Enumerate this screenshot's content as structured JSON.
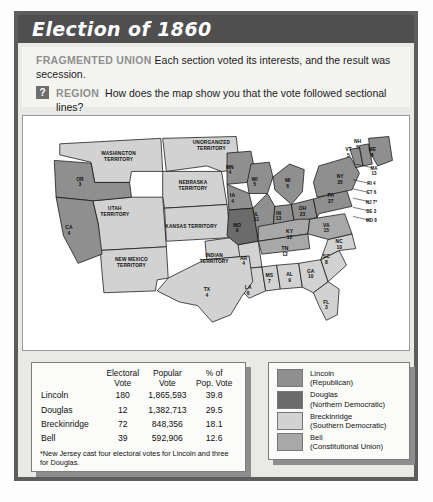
{
  "header": {
    "title": "Election of 1860"
  },
  "caption": {
    "lead": "FRAGMENTED UNION",
    "text": "Each section voted its interests, and the result was secession.",
    "question_icon": "?",
    "region_lead": "REGION",
    "question": "How does the map show you that the vote followed sectional lines?"
  },
  "colors": {
    "lincoln": "#8f8f8f",
    "douglas": "#6b6b6b",
    "breckinridge": "#d2d2d2",
    "bell": "#a8a8a8",
    "water": "#ffffff",
    "title_bar": "#4f4f4f",
    "frame": "#5d5d5d"
  },
  "table": {
    "columns": [
      "",
      "Electoral Vote",
      "Popular Vote",
      "% of Pop. Vote"
    ],
    "column_lines": [
      [
        "",
        ""
      ],
      [
        "Electoral",
        "Vote"
      ],
      [
        "Popular",
        "Vote"
      ],
      [
        "% of",
        "Pop. Vote"
      ]
    ],
    "rows": [
      {
        "name": "Lincoln",
        "electoral": "180",
        "popular": "1,865,593",
        "percent": "39.8"
      },
      {
        "name": "Douglas",
        "electoral": "12",
        "popular": "1,382,713",
        "percent": "29.5"
      },
      {
        "name": "Breckinridge",
        "electoral": "72",
        "popular": "848,356",
        "percent": "18.1"
      },
      {
        "name": "Bell",
        "electoral": "39",
        "popular": "592,906",
        "percent": "12.6"
      }
    ],
    "footnote": "*New Jersey cast four electoral votes for Lincoln and three for Douglas."
  },
  "legend": {
    "items": [
      {
        "name": "Lincoln",
        "party": "(Republican)",
        "color": "#8f8f8f"
      },
      {
        "name": "Douglas",
        "party": "(Northern Democratic)",
        "color": "#6b6b6b"
      },
      {
        "name": "Breckinridge",
        "party": "(Southern Democratic)",
        "color": "#d2d2d2"
      },
      {
        "name": "Bell",
        "party": "(Constitutional Union)",
        "color": "#a8a8a8"
      }
    ]
  },
  "map": {
    "territories": [
      {
        "id": "washington-territory",
        "lines": [
          "WASHINGTON",
          "TERRITORY"
        ],
        "x": 104,
        "y": 32
      },
      {
        "id": "unorganized-territory",
        "lines": [
          "UNORGANIZED",
          "TERRITORY"
        ],
        "x": 205,
        "y": 20
      },
      {
        "id": "nebraska-territory",
        "lines": [
          "NEBRASKA",
          "TERRITORY"
        ],
        "x": 185,
        "y": 64
      },
      {
        "id": "utah-territory",
        "lines": [
          "UTAH",
          "TERRITORY"
        ],
        "x": 100,
        "y": 92
      },
      {
        "id": "kansas-territory",
        "lines": [
          "KANSAS TERRITORY"
        ],
        "x": 183,
        "y": 112
      },
      {
        "id": "new-mexico-territory",
        "lines": [
          "NEW MEXICO",
          "TERRITORY"
        ],
        "x": 118,
        "y": 148
      },
      {
        "id": "indian-territory",
        "lines": [
          "INDIAN",
          "TERRITORY"
        ],
        "x": 208,
        "y": 143
      }
    ],
    "states": [
      {
        "id": "OR",
        "abbr": "OR",
        "votes": "3",
        "x": 62,
        "y": 60,
        "party": "lincoln"
      },
      {
        "id": "CA",
        "abbr": "CA",
        "votes": "4",
        "x": 50,
        "y": 113,
        "party": "lincoln"
      },
      {
        "id": "MN",
        "abbr": "MN",
        "votes": "4",
        "x": 225,
        "y": 47,
        "party": "lincoln"
      },
      {
        "id": "WI",
        "abbr": "WI",
        "votes": "5",
        "x": 252,
        "y": 60,
        "party": "lincoln"
      },
      {
        "id": "MI",
        "abbr": "MI",
        "votes": "6",
        "x": 288,
        "y": 62,
        "party": "lincoln"
      },
      {
        "id": "IA",
        "abbr": "IA",
        "votes": "4",
        "x": 228,
        "y": 78,
        "party": "lincoln"
      },
      {
        "id": "IL",
        "abbr": "IL",
        "votes": "11",
        "x": 254,
        "y": 98,
        "party": "lincoln"
      },
      {
        "id": "IN",
        "abbr": "IN",
        "votes": "13",
        "x": 278,
        "y": 97,
        "party": "lincoln"
      },
      {
        "id": "OH",
        "abbr": "OH",
        "votes": "23",
        "x": 304,
        "y": 92,
        "party": "lincoln"
      },
      {
        "id": "MO",
        "abbr": "MO",
        "votes": "9",
        "x": 233,
        "y": 110,
        "party": "douglas"
      },
      {
        "id": "KY",
        "abbr": "KY",
        "votes": "12",
        "x": 290,
        "y": 117,
        "party": "bell"
      },
      {
        "id": "TN",
        "abbr": "TN",
        "votes": "12",
        "x": 285,
        "y": 136,
        "party": "bell"
      },
      {
        "id": "AR",
        "abbr": "AR",
        "votes": "4",
        "x": 240,
        "y": 146,
        "party": "breckinridge"
      },
      {
        "id": "LA",
        "abbr": "LA",
        "votes": "6",
        "x": 245,
        "y": 178,
        "party": "breckinridge"
      },
      {
        "id": "MS",
        "abbr": "MS",
        "votes": "7",
        "x": 268,
        "y": 165,
        "party": "breckinridge"
      },
      {
        "id": "AL",
        "abbr": "AL",
        "votes": "9",
        "x": 290,
        "y": 164,
        "party": "breckinridge"
      },
      {
        "id": "GA",
        "abbr": "GA",
        "votes": "10",
        "x": 313,
        "y": 160,
        "party": "breckinridge"
      },
      {
        "id": "FL",
        "abbr": "FL",
        "votes": "3",
        "x": 330,
        "y": 194,
        "party": "breckinridge"
      },
      {
        "id": "SC",
        "abbr": "SC",
        "votes": "8",
        "x": 330,
        "y": 144,
        "party": "breckinridge"
      },
      {
        "id": "NC",
        "abbr": "NC",
        "votes": "10",
        "x": 344,
        "y": 128,
        "party": "breckinridge"
      },
      {
        "id": "VA",
        "abbr": "VA",
        "votes": "15",
        "x": 330,
        "y": 110,
        "party": "bell"
      },
      {
        "id": "TX",
        "abbr": "TX",
        "votes": "4",
        "x": 200,
        "y": 180,
        "party": "breckinridge"
      },
      {
        "id": "PA",
        "abbr": "PA",
        "votes": "27",
        "x": 335,
        "y": 78,
        "party": "lincoln"
      },
      {
        "id": "NY",
        "abbr": "NY",
        "votes": "35",
        "x": 345,
        "y": 57,
        "party": "lincoln"
      },
      {
        "id": "VT",
        "abbr": "VT",
        "votes": "5",
        "x": 354,
        "y": 28,
        "party": "lincoln"
      },
      {
        "id": "NH",
        "abbr": "NH",
        "votes": "5",
        "x": 364,
        "y": 19,
        "party": "lincoln"
      },
      {
        "id": "ME",
        "abbr": "ME",
        "votes": "8",
        "x": 380,
        "y": 28,
        "party": "lincoln"
      }
    ],
    "callouts": [
      {
        "id": "MA",
        "label": "MA",
        "votes": "13",
        "x": 382,
        "y": 48,
        "party": "lincoln"
      },
      {
        "id": "RI",
        "label": "RI 4",
        "x": 379,
        "y": 65,
        "party": "lincoln"
      },
      {
        "id": "CT",
        "label": "CT 6",
        "x": 379,
        "y": 75,
        "party": "lincoln"
      },
      {
        "id": "NJ",
        "label": "NJ 7*",
        "x": 379,
        "y": 85,
        "party": "lincoln"
      },
      {
        "id": "DE",
        "label": "DE 3",
        "x": 379,
        "y": 95,
        "party": "lincoln"
      },
      {
        "id": "MD",
        "label": "MD 8",
        "x": 379,
        "y": 105,
        "party": "bell"
      }
    ]
  }
}
